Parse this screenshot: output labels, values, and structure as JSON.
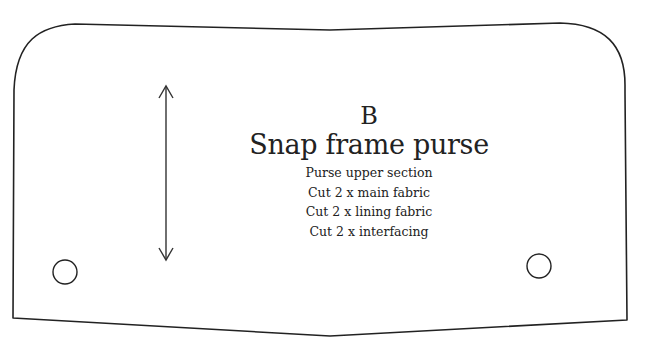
{
  "pattern_piece": {
    "letter": "B",
    "title": "Snap frame purse",
    "instructions": [
      "Purse upper section",
      "Cut 2 x main fabric",
      "Cut 2 x lining fabric",
      "Cut 2 x interfacing"
    ],
    "grainline": "double-headed-arrow",
    "markings": [
      "snap-circle-left",
      "snap-circle-right"
    ],
    "stroke_color": "#222222"
  }
}
